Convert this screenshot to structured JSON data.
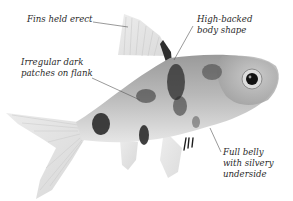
{
  "image": {
    "subject": "Annotated photograph of a barb-type aquarium fish (grayscale)",
    "background_color": "#ffffff",
    "text_color": "#2a2a2a",
    "leader_line_color": "#555555"
  },
  "annotations": [
    {
      "id": "fins",
      "lines": [
        "Fins held erect"
      ]
    },
    {
      "id": "body",
      "lines": [
        "High-backed",
        "body shape"
      ]
    },
    {
      "id": "patches",
      "lines": [
        "Irregular dark",
        "patches on flank"
      ]
    },
    {
      "id": "belly",
      "lines": [
        "Full belly",
        "with silvery",
        "underside"
      ]
    }
  ]
}
